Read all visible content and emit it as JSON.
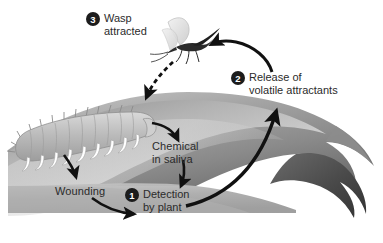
{
  "figure": {
    "background_color": "#ffffff",
    "text_color": "#2b2b2b",
    "badge_color": "#1c1c1c",
    "badge_text_color": "#ffffff",
    "arrow_color": "#111111",
    "leaf_light": "#d8d8d8",
    "leaf_mid": "#a8a8a8",
    "leaf_dark": "#6e6e6e",
    "leaf_tip": "#3c3c3c",
    "caterpillar_body": "#b9b9b9",
    "caterpillar_leg": "#ffffff",
    "wasp_body": "#2a2a2a",
    "wasp_wing": "#e4e4e4"
  },
  "steps": [
    {
      "number": "3",
      "label": "Wasp\nattracted",
      "name": "step-3-wasp-attracted"
    },
    {
      "number": "2",
      "label": "Release of\nvolatile attractants",
      "name": "step-2-release-volatiles"
    },
    {
      "number": "1",
      "label": "Detection\nby plant",
      "name": "step-1-detection-by-plant"
    }
  ],
  "labels": [
    {
      "text": "Chemical\nin saliva",
      "name": "label-chemical-in-saliva"
    },
    {
      "text": "Wounding",
      "name": "label-wounding"
    }
  ],
  "organisms": {
    "caterpillar": "caterpillar",
    "wasp": "wasp",
    "leaf": "leaf"
  },
  "arrows": [
    {
      "name": "arrow-caterpillar-to-chemical",
      "style": "solid"
    },
    {
      "name": "arrow-caterpillar-to-wounding",
      "style": "solid"
    },
    {
      "name": "arrow-wounding-to-detection",
      "style": "solid"
    },
    {
      "name": "arrow-chemical-to-detection",
      "style": "solid"
    },
    {
      "name": "arrow-detection-to-release",
      "style": "solid"
    },
    {
      "name": "arrow-release-to-wasp",
      "style": "solid"
    },
    {
      "name": "arrow-wasp-to-caterpillar",
      "style": "dashed"
    }
  ]
}
